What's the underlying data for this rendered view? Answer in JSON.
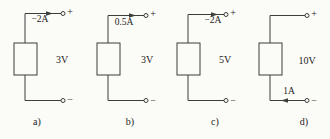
{
  "figure": {
    "circuits": [
      {
        "caption": "a)",
        "current_label": "−2A",
        "current_arrow": "top-wire-pointing-right",
        "voltage": "3V",
        "plus": "+",
        "minus": "−"
      },
      {
        "caption": "b)",
        "current_label": "0.5A",
        "current_arrow": "top-wire-pointing-right",
        "voltage": "3V",
        "plus": "+",
        "minus": "−"
      },
      {
        "caption": "c)",
        "current_label": "−2A",
        "current_arrow": "top-wire-pointing-right",
        "voltage": "5V",
        "plus": "+",
        "minus": "−"
      },
      {
        "caption": "d)",
        "current_label": "1A",
        "current_arrow": "bottom-wire-pointing-left",
        "voltage": "10V",
        "plus": "+",
        "minus": "−"
      }
    ]
  }
}
